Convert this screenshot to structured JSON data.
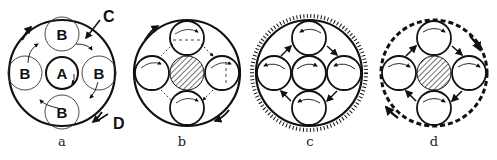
{
  "figures": [
    {
      "id": "a",
      "caption": "a",
      "labels": {
        "center": "A",
        "satellite": "B",
        "callout_c": "C",
        "callout_d": "D"
      }
    },
    {
      "id": "b",
      "caption": "b"
    },
    {
      "id": "c",
      "caption": "c"
    },
    {
      "id": "d",
      "caption": "d"
    }
  ],
  "colors": {
    "ink": "#111111",
    "background": "#ffffff"
  }
}
